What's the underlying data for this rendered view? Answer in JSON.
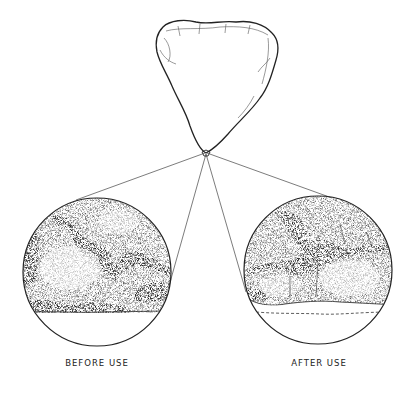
{
  "figure": {
    "type": "illustration",
    "panels": [
      {
        "id": "before",
        "label": "BEFORE USE"
      },
      {
        "id": "after",
        "label": "AFTER USE"
      }
    ],
    "colors": {
      "ink": "#222222",
      "background": "#ffffff"
    }
  }
}
